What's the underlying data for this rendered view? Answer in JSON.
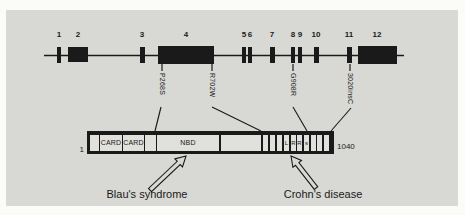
{
  "colors": {
    "panel_background": "#d8d8d4",
    "ink": "#1a1a1a",
    "domain_box_fill": "#e0e0dc"
  },
  "gene": {
    "exon_labels": [
      "1",
      "2",
      "3",
      "4",
      "5",
      "6",
      "7",
      "8",
      "9",
      "10",
      "11",
      "12"
    ],
    "mutation_labels": [
      "P268S",
      "R702W",
      "G908R",
      "3020insC"
    ]
  },
  "protein": {
    "start_residue": "1",
    "end_residue": "1040",
    "domain_labels": [
      "CARD",
      "CARD",
      "NBD"
    ],
    "lrr_letters": [
      "L",
      "R",
      "R",
      "s"
    ]
  },
  "diseases": {
    "blau": "Blau's syndrome",
    "crohn": "Crohn's disease"
  }
}
